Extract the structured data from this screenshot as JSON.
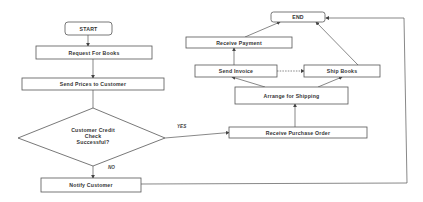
{
  "diagram": {
    "type": "flowchart",
    "nodes": {
      "start": "START",
      "request_books": "Request For Books",
      "send_prices": "Send Prices to Customer",
      "credit_check_line1": "Customer Credit",
      "credit_check_line2": "Check",
      "credit_check_line3": "Successful?",
      "notify_customer": "Notify Customer",
      "receive_po": "Receive Purchase Order",
      "arrange_shipping": "Arrange for Shipping",
      "send_invoice": "Send Invoice",
      "ship_books": "Ship Books",
      "receive_payment": "Receive Payment",
      "end": "END"
    },
    "edge_labels": {
      "yes": "YES",
      "no": "NO"
    },
    "colors": {
      "stroke": "#555555",
      "text": "#333333",
      "background": "#ffffff"
    }
  }
}
